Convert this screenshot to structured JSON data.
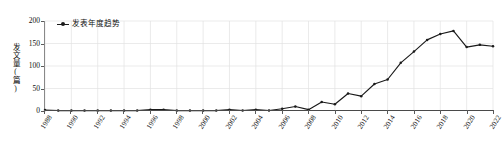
{
  "chart_data": {
    "type": "line",
    "title": "",
    "xlabel": "",
    "ylabel": "发文量(篇)",
    "legend": [
      "发表年度趋势"
    ],
    "legend_position": "top-left",
    "grid": true,
    "ylim": [
      0,
      200
    ],
    "yticks": [
      0,
      50,
      100,
      150,
      200
    ],
    "xlim": [
      1988,
      2022
    ],
    "xticks": [
      1988,
      1990,
      1992,
      1994,
      1996,
      1998,
      2000,
      2002,
      2004,
      2006,
      2008,
      2010,
      2012,
      2014,
      2016,
      2018,
      2020,
      2022
    ],
    "x": [
      1988,
      1989,
      1990,
      1991,
      1992,
      1993,
      1994,
      1995,
      1996,
      1997,
      1998,
      1999,
      2000,
      2001,
      2002,
      2003,
      2004,
      2005,
      2006,
      2007,
      2008,
      2009,
      2010,
      2011,
      2012,
      2013,
      2014,
      2015,
      2016,
      2017,
      2018,
      2019,
      2020,
      2021,
      2022
    ],
    "series": [
      {
        "name": "发表年度趋势",
        "color": "#1a1a1a",
        "marker": "circle",
        "values": [
          2,
          1,
          1,
          1,
          1,
          1,
          1,
          1,
          3,
          3,
          1,
          1,
          1,
          1,
          3,
          1,
          3,
          1,
          5,
          10,
          3,
          20,
          15,
          39,
          33,
          60,
          70,
          107,
          132,
          158,
          171,
          178,
          142,
          147,
          144
        ]
      }
    ]
  },
  "legend": {
    "marker_icon": "line-circle-marker-icon",
    "label": "发表年度趋势"
  },
  "axes": {
    "y_label": "发文量(篇)",
    "y_tick_labels": [
      "200",
      "150",
      "100",
      "50",
      "0"
    ],
    "x_tick_labels": [
      "1988",
      "1990",
      "1992",
      "1994",
      "1996",
      "1998",
      "2000",
      "2002",
      "2004",
      "2006",
      "2008",
      "2010",
      "2012",
      "2014",
      "2016",
      "2018",
      "2020",
      "2022"
    ]
  },
  "colors": {
    "series": "#1a1a1a",
    "axis": "#4a4a4a",
    "grid": "#e2e2e2",
    "background": "#ffffff"
  }
}
